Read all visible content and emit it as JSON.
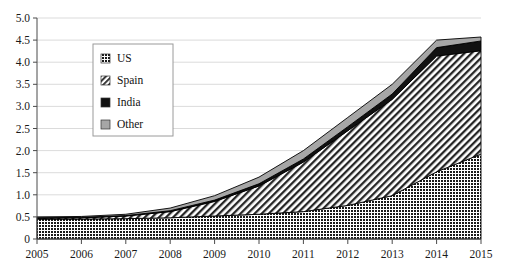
{
  "chart_data": {
    "type": "area",
    "stacked": true,
    "title": "",
    "subtitle": "",
    "xlabel": "",
    "ylabel": "",
    "x": [
      2005,
      2006,
      2007,
      2008,
      2009,
      2010,
      2011,
      2012,
      2013,
      2014,
      2015
    ],
    "categories": [
      "2005",
      "2006",
      "2007",
      "2008",
      "2009",
      "2010",
      "2011",
      "2012",
      "2013",
      "2014",
      "2015"
    ],
    "xtick_labels": [
      "2005",
      "2006",
      "2007",
      "2008",
      "2009",
      "2010",
      "2011",
      "2012",
      "2013",
      "2014",
      "2015"
    ],
    "ytick_labels": [
      "0",
      "0.5",
      "1.0",
      "1.5",
      "2.0",
      "2.5",
      "3.0",
      "3.5",
      "4.0",
      "4.5",
      "5.0"
    ],
    "yticks": [
      0,
      0.5,
      1.0,
      1.5,
      2.0,
      2.5,
      3.0,
      3.5,
      4.0,
      4.5,
      5.0
    ],
    "xlim": [
      2005,
      2015
    ],
    "ylim": [
      0,
      5.0
    ],
    "grid": true,
    "grid_axis": "y",
    "legend_position": "upper-left-inside",
    "series": [
      {
        "name": "US",
        "pattern": "dotted-checker",
        "color": "#1a1a1a",
        "values": [
          0.45,
          0.45,
          0.46,
          0.48,
          0.52,
          0.56,
          0.62,
          0.76,
          0.98,
          1.52,
          1.92
        ]
      },
      {
        "name": "Spain",
        "pattern": "diagonal-hatch",
        "color": "#2b2b2b",
        "values": [
          0.02,
          0.03,
          0.06,
          0.14,
          0.33,
          0.64,
          1.12,
          1.69,
          2.18,
          2.62,
          2.34
        ]
      },
      {
        "name": "India",
        "pattern": "solid",
        "color": "#111111",
        "values": [
          0.01,
          0.01,
          0.01,
          0.02,
          0.03,
          0.05,
          0.07,
          0.09,
          0.12,
          0.19,
          0.22
        ]
      },
      {
        "name": "Other",
        "pattern": "solid-gray",
        "color": "#a6a6a6",
        "values": [
          0.02,
          0.02,
          0.03,
          0.06,
          0.1,
          0.15,
          0.19,
          0.21,
          0.22,
          0.17,
          0.09
        ]
      }
    ],
    "totals": [
      0.5,
      0.51,
      0.56,
      0.7,
      0.98,
      1.4,
      2.0,
      2.75,
      3.5,
      4.5,
      4.57
    ]
  },
  "legend": {
    "entries": [
      {
        "label": "US",
        "swatch": "checker-swatch"
      },
      {
        "label": "Spain",
        "swatch": "hatch-swatch"
      },
      {
        "label": "India",
        "swatch": "solid-black-swatch"
      },
      {
        "label": "Other",
        "swatch": "gray-swatch"
      }
    ]
  },
  "colors": {
    "us": "#1a1a1a",
    "spain": "#2b2b2b",
    "india": "#111111",
    "other": "#a6a6a6",
    "axis": "#4a4a4a",
    "grid": "#d2d2d2",
    "background": "#ffffff"
  }
}
